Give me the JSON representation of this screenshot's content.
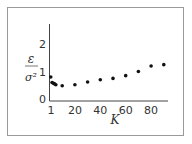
{
  "chart_data": {
    "type": "scatter",
    "title": "",
    "xlabel": "K",
    "ylabel": "ε / σ²",
    "ylabel_num": "ε",
    "ylabel_den": "σ²",
    "x_ticks": [
      "1",
      "20",
      "40",
      "60",
      "80"
    ],
    "y_ticks": [
      "0",
      "1",
      "2"
    ],
    "xlim": [
      0,
      95
    ],
    "ylim": [
      0,
      2.5
    ],
    "grid": false,
    "legend": null,
    "series": [
      {
        "name": "ε/σ²",
        "x": [
          1,
          2,
          3,
          4,
          5,
          10,
          20,
          30,
          40,
          50,
          60,
          70,
          80,
          90
        ],
        "y": [
          0.8,
          0.6,
          0.57,
          0.55,
          0.52,
          0.48,
          0.52,
          0.62,
          0.7,
          0.75,
          0.85,
          1.0,
          1.2,
          1.25
        ]
      }
    ]
  }
}
